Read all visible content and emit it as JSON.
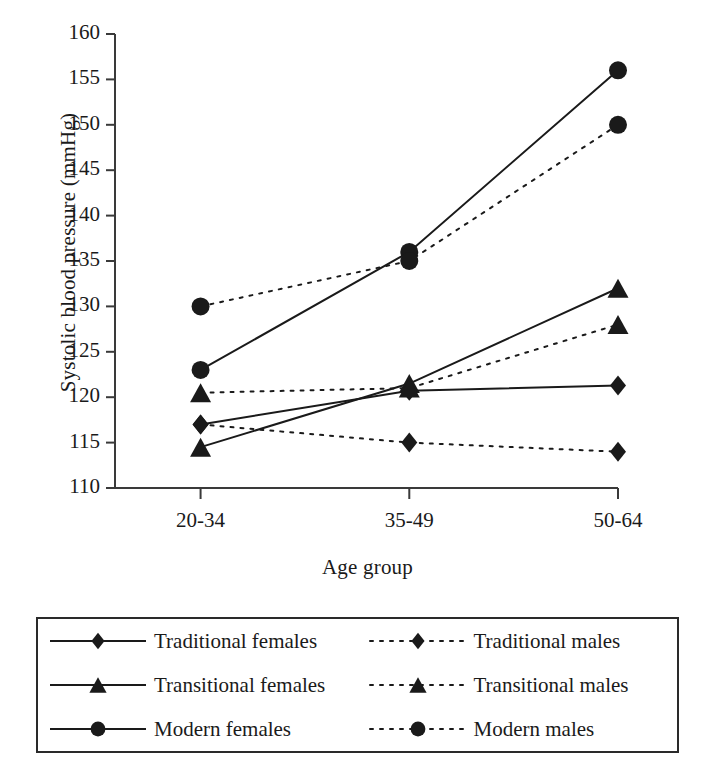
{
  "chart_data": {
    "type": "line",
    "title": "",
    "xlabel": "Age group",
    "ylabel": "Systolic blood pressure (mmHg)",
    "categories": [
      "20-34",
      "35-49",
      "50-64"
    ],
    "ylim": [
      110,
      160
    ],
    "yticks": [
      110,
      115,
      120,
      125,
      130,
      135,
      140,
      145,
      150,
      155,
      160
    ],
    "ytick_labels": [
      "110",
      "115",
      "120",
      "125",
      "130",
      "135",
      "140",
      "145",
      "150",
      "155",
      "160"
    ],
    "grid": false,
    "legend_position": "below-plot",
    "series": [
      {
        "name": "Traditional females",
        "values": [
          117,
          120.7,
          121.3
        ],
        "marker": "diamond",
        "line_style": "solid",
        "color": "#1a1a1a"
      },
      {
        "name": "Transitional females",
        "values": [
          114.5,
          121.5,
          132
        ],
        "marker": "triangle",
        "line_style": "solid",
        "color": "#1a1a1a"
      },
      {
        "name": "Modern females",
        "values": [
          123,
          136,
          156
        ],
        "marker": "circle",
        "line_style": "solid",
        "color": "#1a1a1a"
      },
      {
        "name": "Traditional males",
        "values": [
          117,
          115,
          114
        ],
        "marker": "diamond",
        "line_style": "dotted",
        "color": "#1a1a1a"
      },
      {
        "name": "Transitional males",
        "values": [
          120.5,
          121,
          128
        ],
        "marker": "triangle",
        "line_style": "dotted",
        "color": "#1a1a1a"
      },
      {
        "name": "Modern males",
        "values": [
          130,
          135,
          150
        ],
        "marker": "circle",
        "line_style": "dotted",
        "color": "#1a1a1a"
      }
    ]
  },
  "legend": {
    "items": [
      {
        "label": "Traditional females",
        "marker": "diamond",
        "line_style": "solid"
      },
      {
        "label": "Traditional males",
        "marker": "diamond",
        "line_style": "dotted"
      },
      {
        "label": "Transitional females",
        "marker": "triangle",
        "line_style": "solid"
      },
      {
        "label": "Transitional males",
        "marker": "triangle",
        "line_style": "dotted"
      },
      {
        "label": "Modern females",
        "marker": "circle",
        "line_style": "solid"
      },
      {
        "label": "Modern males",
        "marker": "circle",
        "line_style": "dotted"
      }
    ]
  }
}
